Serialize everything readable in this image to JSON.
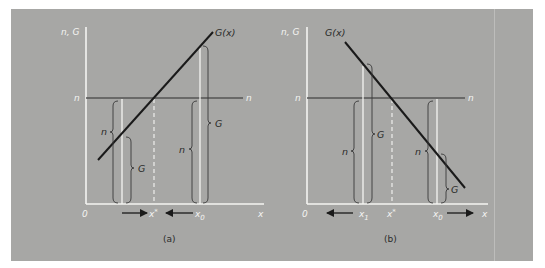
{
  "colors": {
    "background": "#ffffff",
    "panel": "#a7a7a5",
    "axes": "#f4f4f2",
    "n_line": "#555555",
    "g_line": "#1a1a1a",
    "brace": "#3a3a3a",
    "arrow": "#1a1a1a"
  },
  "panels": [
    {
      "caption": "(a)",
      "y_axis_label": "n, G",
      "x_axis_label": "x",
      "origin_label": "0",
      "n_level_label_left": "n",
      "n_level_label_right": "n",
      "curve_label": "G(x)",
      "curve_slope": "increasing",
      "x_marks": [
        {
          "label": "x*",
          "role": "equilibrium"
        },
        {
          "label": "x0",
          "role": "initial"
        }
      ],
      "brace_labels": [
        "n",
        "G",
        "n",
        "G"
      ],
      "arrows": [
        "right toward x*",
        "left toward x*"
      ]
    },
    {
      "caption": "(b)",
      "y_axis_label": "n, G",
      "x_axis_label": "x",
      "origin_label": "0",
      "n_level_label_left": "n",
      "n_level_label_right": "n",
      "curve_label": "G(x)",
      "curve_slope": "decreasing",
      "x_marks": [
        {
          "label": "x1",
          "role": "left point"
        },
        {
          "label": "x*",
          "role": "equilibrium"
        },
        {
          "label": "x0",
          "role": "initial"
        }
      ],
      "brace_labels": [
        "n",
        "G",
        "n",
        "G"
      ],
      "arrows": [
        "left away from x*",
        "right away from x*"
      ]
    }
  ],
  "text": {
    "a": {
      "ylab": "n, G",
      "glab": "G(x)",
      "nl": "n",
      "nr": "n",
      "zero": "0",
      "x": "x",
      "xstar": "x",
      "xstar_sup": "*",
      "x0": "x",
      "x0_sub": "0",
      "b_n1": "n",
      "b_g1": "G",
      "b_n2": "n",
      "b_g2": "G",
      "caption": "(a)"
    },
    "b": {
      "ylab": "n, G",
      "glab": "G(x)",
      "nl": "n",
      "nr": "n",
      "zero": "0",
      "x": "x",
      "x1": "x",
      "x1_sub": "1",
      "xstar": "x",
      "xstar_sup": "*",
      "x0": "x",
      "x0_sub": "0",
      "b_n1": "n",
      "b_g1": "G",
      "b_n2": "n",
      "b_g2": "G",
      "caption": "(b)"
    }
  }
}
